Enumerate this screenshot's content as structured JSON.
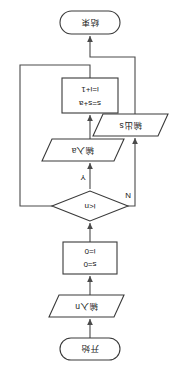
{
  "diagram": {
    "orientation_note": "rotated-180",
    "colors": {
      "background": "#ffffff",
      "stroke": "#3a3a3a",
      "connector": "#4a4a4a",
      "text": "#1a1a1a"
    },
    "nodes": {
      "start": {
        "label": "开始",
        "shape": "terminator"
      },
      "input_n": {
        "label": "输入n",
        "shape": "parallelogram"
      },
      "init": {
        "line1": "s=0",
        "line2": "i=0",
        "shape": "rectangle"
      },
      "decision": {
        "label": "i<n",
        "shape": "diamond"
      },
      "input_a": {
        "label": "输入a",
        "shape": "parallelogram"
      },
      "accumulate": {
        "line1": "s=s+a",
        "line2": "i=i+1",
        "shape": "rectangle"
      },
      "output_s": {
        "label": "输出s",
        "shape": "parallelogram"
      },
      "end": {
        "label": "结束",
        "shape": "terminator"
      }
    },
    "branch_labels": {
      "yes": "Y",
      "no": "N"
    }
  }
}
